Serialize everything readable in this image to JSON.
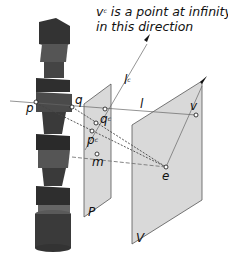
{
  "caption": {
    "line1_prefix": "v",
    "line1_sup": "c",
    "line1_rest": " is a point at infinity",
    "line2": "in this direction"
  },
  "labels": {
    "p": "p",
    "q": "q",
    "l": "l",
    "lc_base": "l",
    "lc_sup": "c",
    "qc_base": "q",
    "qc_sup": "c",
    "pc_base": "p",
    "pc_sup": "c",
    "m": "m",
    "v": "v",
    "e": "e",
    "P": "P",
    "V": "V"
  },
  "colors": {
    "plane_fill": "#d9d9d9",
    "plane_stroke": "#555555",
    "object_dark": "#2e2e2e",
    "object_mid": "#4a4a4a",
    "object_light": "#6a6a6a",
    "line": "#555555"
  }
}
